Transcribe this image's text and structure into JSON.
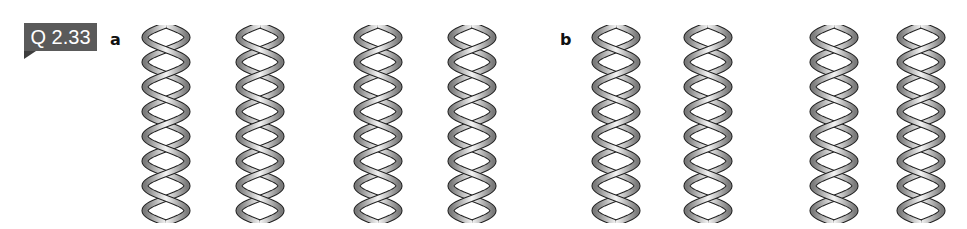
{
  "question_badge": {
    "label": "Q 2.33"
  },
  "panels": [
    {
      "label": "a",
      "helices": [
        {
          "x": 138,
          "handedness": "right"
        },
        {
          "x": 232,
          "handedness": "right"
        },
        {
          "x": 350,
          "handedness": "left"
        },
        {
          "x": 444,
          "handedness": "left"
        }
      ]
    },
    {
      "label": "b",
      "helices": [
        {
          "x": 588,
          "handedness": "right"
        },
        {
          "x": 680,
          "handedness": "left"
        },
        {
          "x": 806,
          "handedness": "right"
        },
        {
          "x": 893,
          "handedness": "left"
        }
      ]
    }
  ],
  "colors": {
    "badge_bg": "#5a5a5a",
    "badge_tail": "#3d3d3d",
    "ribbon_light": "#f4f4f4",
    "ribbon_dark": "#7a7a7a",
    "outline": "#222222"
  }
}
